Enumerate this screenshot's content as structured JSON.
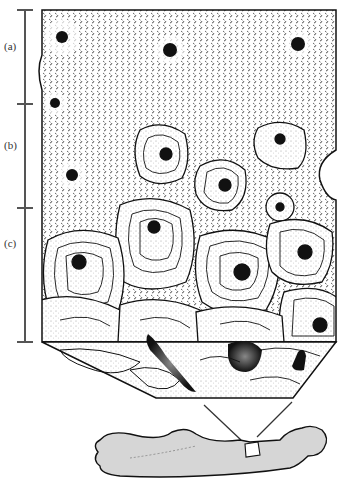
{
  "figure": {
    "scale_bar": {
      "labels": [
        "(a)",
        "(b)",
        "(c)"
      ]
    },
    "colors": {
      "ink": "#111111",
      "bar": "#555555",
      "bone_fill": "#d6d6d6",
      "background": "#ffffff"
    }
  }
}
